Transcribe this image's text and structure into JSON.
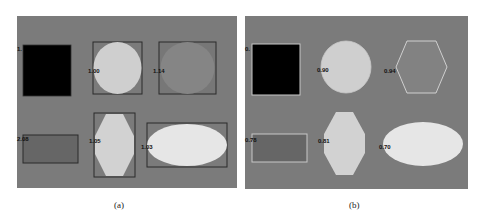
{
  "figure": {
    "panels": [
      {
        "id": "a",
        "caption": "(a)",
        "background": "#7b7b7b",
        "labels": [
          "1.",
          "1.00",
          "1.14",
          "2.08",
          "1.05",
          "1.03"
        ]
      },
      {
        "id": "b",
        "caption": "(b)",
        "background": "#7b7b7b",
        "labels": [
          "0.",
          "0.90",
          "0.94",
          "0.78",
          "0.81",
          "0.70"
        ]
      }
    ]
  },
  "colors": {
    "background": "#7b7b7b",
    "black_shape": "#000000",
    "light_shape": "#cfcfcf",
    "lighter_shape": "#e6e6e6",
    "mid_shape": "#858585",
    "dark_rect": "#666666",
    "box_stroke_a": "#2a2a2a",
    "box_stroke_b": "#c8c8c8"
  }
}
